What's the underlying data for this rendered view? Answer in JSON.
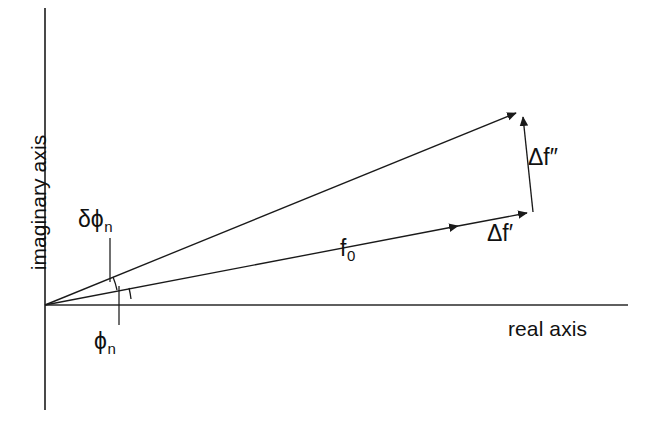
{
  "figure": {
    "type": "argand-vector-diagram",
    "title": "",
    "background_color": "#ffffff",
    "line_color": "#1a1a1a",
    "text_color": "#111111"
  },
  "axes": {
    "real": {
      "label": "real axis",
      "orientation": "horizontal",
      "start": [
        45,
        305
      ],
      "end": [
        628,
        305
      ]
    },
    "imaginary": {
      "label": "imaginary axis",
      "orientation": "vertical",
      "start": [
        45,
        8
      ],
      "end": [
        45,
        410
      ]
    },
    "origin": [
      45,
      305
    ]
  },
  "vectors": [
    {
      "name": "f0",
      "label": "f",
      "subscript": "0",
      "from": [
        45,
        305
      ],
      "to": [
        465,
        225
      ],
      "arrowhead": true,
      "description": "normal scattering factor along angle phi_n"
    },
    {
      "name": "delta-f-prime",
      "label": "Δf",
      "prime": "′",
      "from": [
        465,
        225
      ],
      "to": [
        533,
        212
      ],
      "arrowhead": true,
      "description": "real dispersive correction, parallel to f0"
    },
    {
      "name": "delta-f-double-prime",
      "label": "Δf",
      "prime": "″",
      "from": [
        533,
        212
      ],
      "to": [
        522,
        110
      ],
      "arrowhead": true,
      "description": "imaginary absorption correction, perpendicular to f0"
    },
    {
      "name": "resultant",
      "label": "",
      "from": [
        45,
        305
      ],
      "to": [
        522,
        110
      ],
      "arrowhead": true,
      "description": "total scattering factor at angle phi_n + delta phi_n"
    }
  ],
  "angles": [
    {
      "name": "phi-n",
      "label": "ϕ",
      "subscript": "n",
      "between": [
        "real-axis",
        "f0"
      ],
      "arc_radius": 86,
      "leader_from": [
        118,
        340
      ],
      "leader_to": [
        118,
        283
      ]
    },
    {
      "name": "delta-phi-n",
      "label": "δϕ",
      "subscript": "n",
      "between": [
        "f0",
        "resultant"
      ],
      "arc_radius": 73,
      "leader_from": [
        110,
        238
      ],
      "leader_to": [
        110,
        287
      ]
    }
  ],
  "labels": {
    "imaginary_axis": "imaginary axis",
    "real_axis": "real axis",
    "f0_base": "f",
    "f0_sub": "0",
    "df_prime_base": "Δf",
    "df_prime_mark": "′",
    "df_double_prime_base": "Δf",
    "df_double_prime_mark": "″",
    "delta_phi_n_base": "δϕ",
    "delta_phi_n_sub": "n",
    "phi_n_base": "ϕ",
    "phi_n_sub": "n"
  }
}
